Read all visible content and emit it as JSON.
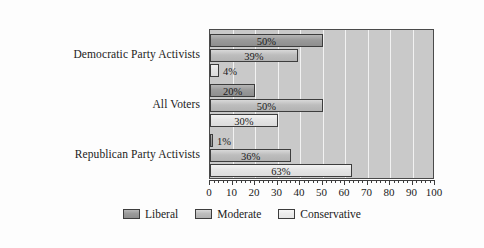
{
  "chart_data": {
    "type": "bar",
    "orientation": "horizontal",
    "title": "",
    "xlabel": "",
    "ylabel": "",
    "xlim": [
      0,
      100
    ],
    "xticks": [
      0,
      10,
      20,
      30,
      40,
      50,
      60,
      70,
      80,
      90,
      100
    ],
    "xtick_labels": [
      "0",
      "10",
      "20",
      "30",
      "40",
      "50",
      "60",
      "70",
      "80",
      "90",
      "100"
    ],
    "minor_tick_step": 2,
    "grid": true,
    "grid_axis": "x",
    "grid_color": "#f2f2f2",
    "plot_background": "#c9c9c9",
    "legend_position": "bottom-center",
    "categories": [
      "Democratic Party Activists",
      "All Voters",
      "Republican Party Activists"
    ],
    "series": [
      {
        "name": "Liberal",
        "color": "#9a9a9a",
        "values": [
          50,
          20,
          1
        ],
        "labels": [
          "50%",
          "20%",
          "1%"
        ]
      },
      {
        "name": "Moderate",
        "color": "#bdbdbd",
        "values": [
          39,
          50,
          36
        ],
        "labels": [
          "39%",
          "50%",
          "36%"
        ]
      },
      {
        "name": "Conservative",
        "color": "#e4e4e4",
        "values": [
          4,
          30,
          63
        ],
        "labels": [
          "4%",
          "30%",
          "63%"
        ]
      }
    ],
    "legend_entries": [
      "Liberal",
      "Moderate",
      "Conservative"
    ]
  }
}
